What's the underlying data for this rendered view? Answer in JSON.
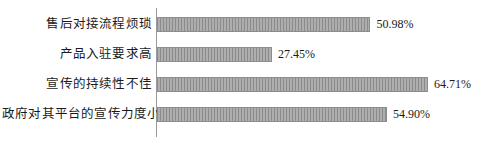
{
  "chart_data": {
    "type": "bar",
    "orientation": "horizontal",
    "title": "",
    "subtitle": "",
    "xlabel": "",
    "ylabel": "",
    "grid": false,
    "legend": null,
    "axis_line": "vertical-category-axis",
    "xlim": [
      0,
      64.71
    ],
    "categories": [
      "售后对接流程烦琐",
      "产品入驻要求高",
      "宣传的持续性不佳",
      "政府对其平台的宣传力度小"
    ],
    "values": [
      50.98,
      27.45,
      64.71,
      54.9
    ],
    "value_labels": [
      "50.98%",
      "27.45%",
      "64.71%",
      "54.90%"
    ],
    "bar_color": "#9b9b9b",
    "bar_edge_color": "#8d8d8d",
    "bar_pattern": "vertical-stripes",
    "axis_color": "#9a9a9a",
    "text_color": "#1a1a1a",
    "background": "#ffffff"
  }
}
